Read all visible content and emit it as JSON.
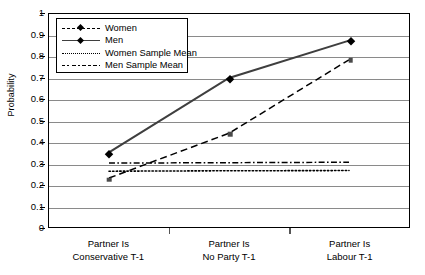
{
  "chart_data": {
    "type": "line",
    "title": "",
    "xlabel": "",
    "ylabel": "Probability",
    "ylim": [
      0,
      1
    ],
    "ytick_step": 0.1,
    "grid": true,
    "legend_position": "top-left-inside",
    "categories": [
      "Partner Is Conservative T-1",
      "Partner Is No Party T-1",
      "Partner Is Labour T-1"
    ],
    "category_lines": [
      [
        "Partner Is",
        "Conservative T-1"
      ],
      [
        "Partner Is",
        "No Party T-1"
      ],
      [
        "Partner Is",
        "Labour T-1"
      ]
    ],
    "ytick_labels": [
      "1",
      "0.9",
      "0.8",
      "0.7",
      "0.6",
      "0.5",
      "0.4",
      "0.3",
      "0.2",
      "0.1",
      "0"
    ],
    "ytick_values": [
      1,
      0.9,
      0.8,
      0.7,
      0.6,
      0.5,
      0.4,
      0.3,
      0.2,
      0.1,
      0
    ],
    "series": [
      {
        "name": "Women",
        "style": "dashed",
        "marker": "square",
        "color": "#000000",
        "values": [
          0.23,
          0.44,
          0.785
        ]
      },
      {
        "name": "Men",
        "style": "solid",
        "marker": "diamond",
        "color": "#3f3f3f",
        "values": [
          0.35,
          0.7,
          0.875
        ]
      },
      {
        "name": "Women Sample Mean",
        "style": "dotted",
        "marker": "none",
        "color": "#000000",
        "values": [
          0.262,
          0.264,
          0.265
        ]
      },
      {
        "name": "Men Sample Mean",
        "style": "dashdot",
        "marker": "none",
        "color": "#000000",
        "values": [
          0.3,
          0.302,
          0.304
        ]
      }
    ]
  },
  "legend": {
    "items": [
      {
        "label": "Women",
        "style": "dashed",
        "marker": "diamond"
      },
      {
        "label": "Men",
        "style": "solid",
        "marker": "diamond"
      },
      {
        "label": "Women Sample Mean",
        "style": "dotted",
        "marker": "none"
      },
      {
        "label": "Men Sample Mean",
        "style": "dashdot",
        "marker": "none"
      }
    ]
  },
  "axis": {
    "y_title": "Probability"
  }
}
